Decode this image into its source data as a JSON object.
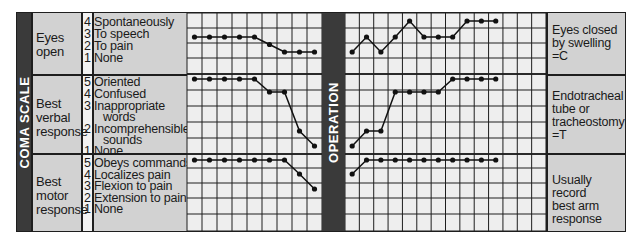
{
  "left_bar_label": "COMA SCALE",
  "middle_bar_label": "OPERATION",
  "categories": [
    {
      "label_lines": [
        "Eyes",
        "open"
      ],
      "responses": [
        {
          "score": "4",
          "text": "Spontaneously"
        },
        {
          "score": "3",
          "text": "To speech"
        },
        {
          "score": "2",
          "text": "To pain"
        },
        {
          "score": "1",
          "text": "None"
        }
      ],
      "note_lines": [
        "Eyes closed",
        "by swelling",
        "=C"
      ]
    },
    {
      "label_lines": [
        "Best",
        "verbal",
        "response"
      ],
      "responses": [
        {
          "score": "5",
          "text": "Oriented"
        },
        {
          "score": "4",
          "text": "Confused"
        },
        {
          "score": "3",
          "text": "Inappropriate",
          "text2": "words"
        },
        {
          "score": "2",
          "text": "Incomprehensible",
          "text2": "sounds"
        },
        {
          "score": "1",
          "text": "None"
        }
      ],
      "note_lines": [
        "Endotracheal",
        "tube or",
        "tracheostomy",
        "=T"
      ]
    },
    {
      "label_lines": [
        "Best",
        "motor",
        "response"
      ],
      "responses": [
        {
          "score": "5",
          "text": "Obeys commands"
        },
        {
          "score": "4",
          "text": "Localizes pain"
        },
        {
          "score": "3",
          "text": "Flexion to pain"
        },
        {
          "score": "2",
          "text": "Extension to pain"
        },
        {
          "score": "1",
          "text": "None"
        }
      ],
      "note_lines": [
        "Usually record",
        "best arm",
        "response"
      ]
    }
  ],
  "colors": {
    "panel_bg": "#d2d2d2",
    "grid_bg": "#eeeeee",
    "bar_bg": "#3a3a3a",
    "line": "#1e1e1e"
  },
  "chart_data": [
    {
      "type": "line",
      "title": "Glasgow Coma Scale - pre-operation",
      "xlabel": "Observation",
      "ylabel": "Score",
      "grid": true,
      "series": [
        {
          "name": "Eyes open",
          "x": [
            1,
            2,
            3,
            4,
            5,
            6,
            7,
            8,
            9
          ],
          "values": [
            3,
            3,
            3,
            3,
            3,
            2.5,
            2,
            2,
            2
          ],
          "ylim": [
            1,
            4
          ]
        },
        {
          "name": "Best verbal response",
          "x": [
            1,
            2,
            3,
            4,
            5,
            6,
            7,
            8,
            9
          ],
          "values": [
            5,
            5,
            5,
            5,
            5,
            4,
            4,
            2,
            1
          ],
          "ylim": [
            1,
            5
          ]
        },
        {
          "name": "Best motor response",
          "x": [
            1,
            2,
            3,
            4,
            5,
            6,
            7,
            8,
            9
          ],
          "values": [
            5,
            5,
            5,
            5,
            5,
            5,
            5,
            4,
            3
          ],
          "ylim": [
            1,
            5
          ]
        }
      ]
    },
    {
      "type": "line",
      "title": "Glasgow Coma Scale - post-operation",
      "xlabel": "Observation",
      "ylabel": "Score",
      "grid": true,
      "series": [
        {
          "name": "Eyes open",
          "x": [
            1,
            2,
            3,
            4,
            5,
            6,
            7,
            8,
            9,
            10,
            11
          ],
          "values": [
            2,
            3,
            2,
            3,
            4,
            3,
            3,
            3,
            4,
            4,
            4
          ],
          "ylim": [
            1,
            4
          ]
        },
        {
          "name": "Best verbal response",
          "x": [
            1,
            2,
            3,
            4,
            5,
            6,
            7,
            8,
            9,
            10,
            11
          ],
          "values": [
            1,
            2,
            2,
            4,
            4,
            4,
            4,
            5,
            5,
            5,
            5
          ],
          "ylim": [
            1,
            5
          ]
        },
        {
          "name": "Best motor response",
          "x": [
            1,
            2,
            3,
            4,
            5,
            6,
            7,
            8,
            9,
            10,
            11
          ],
          "values": [
            4,
            5,
            5,
            5,
            5,
            5,
            5,
            5,
            5,
            5,
            5
          ],
          "ylim": [
            1,
            5
          ]
        }
      ]
    }
  ]
}
